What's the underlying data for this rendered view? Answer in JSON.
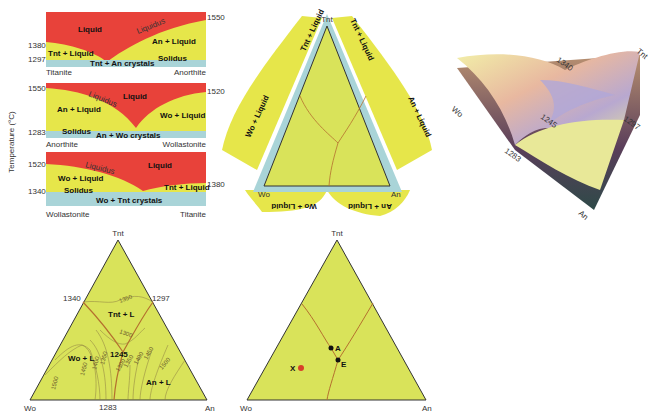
{
  "colors": {
    "liquid": "#e8423a",
    "two_phase": "#e6e64a",
    "solid": "#a9d4d8",
    "ternary_fill": "#d9e35a",
    "boundary": "#b5702e",
    "point_x": "#d8402a",
    "point": "#111111"
  },
  "binaries": {
    "axis_label": "Temperature (°C)",
    "panels": [
      {
        "left_end": "Titanite",
        "right_end": "Anorthite",
        "left_temp": "1380",
        "right_temp": "1550",
        "eutectic_temp": "1297",
        "liquid": "Liquid",
        "liquidus": "Liquidus",
        "solidus": "Solidus",
        "left_field": "Tnt + Liquid",
        "right_field": "An + Liquid",
        "crystals": "Tnt + An crystals"
      },
      {
        "left_end": "Anorthite",
        "right_end": "Wollastonite",
        "left_temp": "1550",
        "right_temp": "1520",
        "eutectic_temp": "1283",
        "liquid": "Liquid",
        "liquidus": "Liquidus",
        "solidus": "Solidus",
        "left_field": "An + Liquid",
        "right_field": "Wo + Liquid",
        "crystals": "An + Wo crystals"
      },
      {
        "left_end": "Wollastonite",
        "right_end": "Titanite",
        "left_temp": "1520",
        "right_temp": "1380",
        "eutectic_temp": "1340",
        "liquid": "Liquid",
        "liquidus": "Liquidus",
        "solidus": "Solidus",
        "left_field": "Wo + Liquid",
        "right_field": "Tnt + Liquid",
        "crystals": "Wo + Tnt crystals"
      }
    ]
  },
  "unfolded": {
    "apex_top": "Tnt",
    "apex_left": "Wo",
    "apex_right": "An",
    "flaps": [
      "Tnt + Liquid",
      "Tnt + Liquid",
      "Wo + Liquid",
      "An + Liquid",
      "Wo + Liquid",
      "An + Liquid"
    ]
  },
  "block3d": {
    "corner_top": "Tnt",
    "corner_left": "Wo",
    "corner_bottom": "An",
    "temps": [
      "1340",
      "1245",
      "1297",
      "1283"
    ]
  },
  "liquidus_projection": {
    "apex_top": "Tnt",
    "apex_left": "Wo",
    "apex_right": "An",
    "edge_temps": {
      "wo_tnt": "1340",
      "tnt_an": "1297",
      "wo_an": "1283"
    },
    "ternary_eutectic": "1245",
    "fields": [
      "Tnt + L",
      "Wo + L",
      "An + L"
    ],
    "isotherms": [
      "1350",
      "1300",
      "1500",
      "1450",
      "1400",
      "1350",
      "1300",
      "1350",
      "1400",
      "1450",
      "1500"
    ]
  },
  "path_diagram": {
    "apex_top": "Tnt",
    "apex_left": "Wo",
    "apex_right": "An",
    "points": [
      {
        "label": "X",
        "color": "#d8402a"
      },
      {
        "label": "A",
        "color": "#111111"
      },
      {
        "label": "E",
        "color": "#111111"
      }
    ]
  }
}
